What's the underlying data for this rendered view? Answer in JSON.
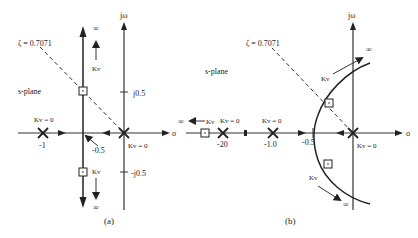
{
  "diagram": {
    "panel_a": {
      "caption": "(a)",
      "plane_label": "s-plane",
      "zeta_label": "ζ = 0.7071",
      "axis_jw": "jω",
      "axis_sigma": "σ",
      "tick_j05": "j0.5",
      "tick_mj05": "-j0.5",
      "pole_left_label": "Kv = 0",
      "pole_left_value": "-1",
      "pole_origin_label": "Kv = 0",
      "breakaway_label": "-0.5",
      "ku_up": "Kv",
      "ku_down": "Kv",
      "infinity": "∞"
    },
    "panel_b": {
      "caption": "(b)",
      "plane_label": "s-plane",
      "zeta_label": "ζ = 0.7071",
      "axis_jw": "jω",
      "axis_sigma": "σ",
      "pole_m20_label": "Kv = 0",
      "pole_m20_value": "-20",
      "pole_m1_label": "Kv = 0",
      "pole_m1_value": "-1.0",
      "tick_m05": "-0.5",
      "pole_origin_label": "Kv = 0",
      "left_arrow_label": "Kv",
      "upper_branch_label": "Kv",
      "lower_branch_label": "Kv",
      "infinity": "∞"
    }
  }
}
